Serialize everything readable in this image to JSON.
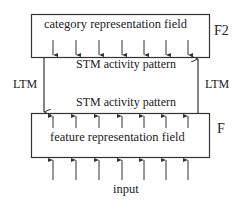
{
  "diagram": {
    "top_field": {
      "label": "category representation field",
      "tag": "F2"
    },
    "bottom_field": {
      "label": "feature representation field",
      "tag": "F"
    },
    "top_stm_label": "STM activity pattern",
    "bottom_stm_label": "STM activity pattern",
    "ltm_left_label": "LTM",
    "ltm_right_label": "LTM",
    "input_label": "input",
    "arrow_x_positions": [
      53,
      76,
      99,
      122,
      144,
      166,
      188
    ],
    "colors": {
      "stroke": "#333333",
      "text": "#222222",
      "background": "#ffffff"
    }
  }
}
